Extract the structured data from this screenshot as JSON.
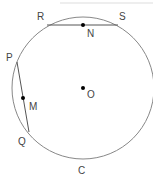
{
  "diagram": {
    "circle": {
      "name": "C",
      "center_label": "O"
    },
    "chords": [
      {
        "endpoints": [
          "R",
          "S"
        ],
        "midpoint": "N"
      },
      {
        "endpoints": [
          "P",
          "Q"
        ],
        "midpoint": "M"
      }
    ],
    "labels": {
      "R": "R",
      "S": "S",
      "N": "N",
      "P": "P",
      "M": "M",
      "O": "O",
      "Q": "Q",
      "C": "C"
    }
  }
}
